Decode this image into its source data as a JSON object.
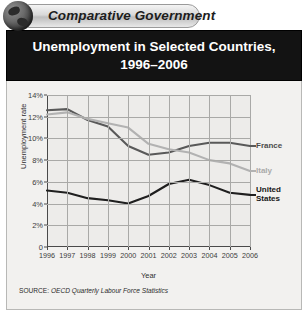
{
  "banner": {
    "label": "Comparative Government",
    "icon": "globe-icon"
  },
  "chart_title": {
    "line1": "Unemployment in Selected Countries,",
    "line2": "1996–2006"
  },
  "source": {
    "label": "SOURCE:",
    "text": "OECD Quarterly Labour Force Statistics"
  },
  "chart_data": {
    "type": "line",
    "title": "Unemployment in Selected Countries, 1996–2006",
    "xlabel": "Year",
    "ylabel": "Unemployment rate",
    "x": [
      1996,
      1997,
      1998,
      1999,
      2000,
      2001,
      2002,
      2003,
      2004,
      2005,
      2006
    ],
    "xtick_labels": [
      "1996",
      "1997",
      "1998",
      "1999",
      "2000",
      "2001",
      "2002",
      "2003",
      "2004",
      "2005",
      "2006"
    ],
    "ytick_labels": [
      "0",
      "2%",
      "4%",
      "6%",
      "8%",
      "10%",
      "12%",
      "14%"
    ],
    "ytick_values": [
      0,
      2,
      4,
      6,
      8,
      10,
      12,
      14
    ],
    "ylim": [
      0,
      14
    ],
    "xlim": [
      1996,
      2006
    ],
    "grid": true,
    "legend_position": "right-inline",
    "series": [
      {
        "name": "France",
        "color": "#595959",
        "values": [
          12.6,
          12.7,
          11.7,
          11.1,
          9.3,
          8.5,
          8.7,
          9.3,
          9.6,
          9.6,
          9.3
        ]
      },
      {
        "name": "Italy",
        "color": "#b2b2b2",
        "values": [
          12.2,
          12.4,
          11.8,
          11.4,
          11.0,
          9.5,
          9.0,
          8.7,
          8.0,
          7.7,
          7.0
        ]
      },
      {
        "name": "United States",
        "color": "#1f1f1f",
        "values": [
          5.2,
          5.0,
          4.5,
          4.3,
          4.0,
          4.7,
          5.8,
          6.2,
          5.7,
          5.0,
          4.8
        ]
      }
    ]
  },
  "legend": [
    {
      "label": "France",
      "color": "#4c4c4c"
    },
    {
      "label": "Italy",
      "color": "#aaaaaa"
    },
    {
      "label": "United",
      "label2": "States",
      "color": "#161616"
    }
  ]
}
